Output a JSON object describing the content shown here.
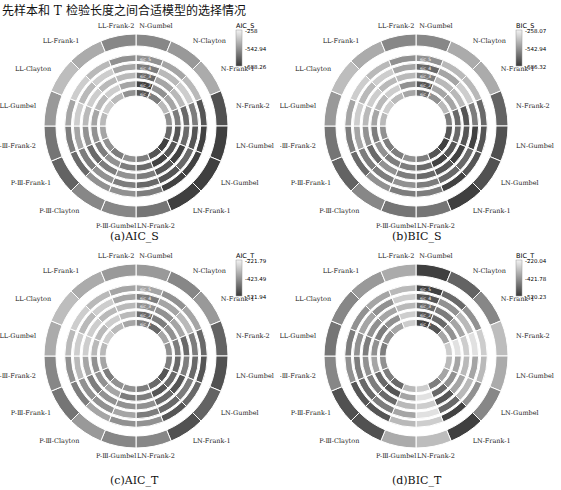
{
  "title": "先样本和 T 检验长度之间合适模型的选择情况",
  "chart_data": [
    {
      "type": "heatmap",
      "subtype": "polar",
      "id": "a",
      "caption": "(a)AIC_S",
      "colorbar": {
        "title": "AIC_S",
        "ticks": [
          "-258",
          "-542.94",
          "-688.26"
        ],
        "min": -688.26,
        "max": -258
      },
      "categories": [
        "N-Gumbel",
        "N-Clayton",
        "N-Frank-1",
        "N-Frank-2",
        "LN-Gumbel",
        "LN-Gumbel",
        "LN-Frank-1",
        "LN-Frank-2",
        "P-Ⅲ-Gumbel",
        "P-Ⅲ-Clayton",
        "P-Ⅲ-Frank-1",
        "P-Ⅲ-Frank-2",
        "LL-Gumbel",
        "LL-Clayton",
        "LL-Frank-1",
        "LL-Frank-2"
      ],
      "rings": [
        "sic_1",
        "sic_2",
        "sic_3",
        "sic_4",
        "sic_5"
      ],
      "values": [
        [
          0.8,
          0.6,
          0.3,
          0.5,
          0.7,
          0.9,
          0.8,
          0.6,
          0.5,
          0.6,
          0.5,
          0.4,
          0.3,
          0.2,
          0.3,
          0.5
        ],
        [
          0.9,
          0.5,
          0.4,
          0.6,
          0.8,
          0.8,
          0.9,
          0.7,
          0.6,
          0.5,
          0.6,
          0.5,
          0.4,
          0.3,
          0.2,
          0.4
        ],
        [
          0.7,
          0.4,
          0.3,
          0.7,
          0.7,
          0.9,
          0.8,
          0.6,
          0.5,
          0.6,
          0.7,
          0.5,
          0.3,
          0.2,
          0.3,
          0.3
        ],
        [
          0.6,
          0.3,
          0.2,
          0.6,
          0.8,
          0.7,
          0.8,
          0.7,
          0.6,
          0.5,
          0.6,
          0.4,
          0.2,
          0.3,
          0.2,
          0.4
        ],
        [
          0.5,
          0.4,
          0.3,
          0.8,
          0.9,
          0.9,
          0.9,
          0.6,
          0.5,
          0.5,
          0.7,
          0.6,
          0.4,
          0.2,
          0.3,
          0.5
        ]
      ]
    },
    {
      "type": "heatmap",
      "subtype": "polar",
      "id": "b",
      "caption": "(b)BIC_S",
      "colorbar": {
        "title": "BIC_S",
        "ticks": [
          "-258.07",
          "-542.94",
          "-686.32"
        ],
        "min": -686.32,
        "max": -258.07
      },
      "categories": [
        "N-Gumbel",
        "N-Clayton",
        "N-Frank-1",
        "N-Frank-2",
        "LN-Gumbel",
        "LN-Gumbel",
        "LN-Frank-1",
        "LN-Frank-2",
        "P-Ⅲ-Gumbel",
        "P-Ⅲ-Clayton",
        "P-Ⅲ-Frank-1",
        "P-Ⅲ-Frank-2",
        "LL-Gumbel",
        "LL-Clayton",
        "LL-Frank-1",
        "LL-Frank-2"
      ],
      "rings": [
        "sic_1",
        "sic_2",
        "sic_3",
        "sic_4",
        "sic_5"
      ],
      "values": [
        [
          0.7,
          0.5,
          0.3,
          0.6,
          0.8,
          0.9,
          0.8,
          0.6,
          0.5,
          0.6,
          0.6,
          0.5,
          0.3,
          0.2,
          0.3,
          0.4
        ],
        [
          0.8,
          0.4,
          0.4,
          0.7,
          0.7,
          0.8,
          0.9,
          0.7,
          0.6,
          0.6,
          0.5,
          0.6,
          0.4,
          0.3,
          0.2,
          0.5
        ],
        [
          0.6,
          0.3,
          0.3,
          0.8,
          0.8,
          0.9,
          0.8,
          0.7,
          0.6,
          0.5,
          0.7,
          0.5,
          0.3,
          0.2,
          0.3,
          0.3
        ],
        [
          0.7,
          0.4,
          0.2,
          0.6,
          0.9,
          0.7,
          0.7,
          0.6,
          0.5,
          0.6,
          0.6,
          0.4,
          0.2,
          0.3,
          0.2,
          0.4
        ],
        [
          0.5,
          0.3,
          0.3,
          0.7,
          0.8,
          0.8,
          0.9,
          0.6,
          0.6,
          0.5,
          0.7,
          0.6,
          0.4,
          0.2,
          0.3,
          0.5
        ]
      ]
    },
    {
      "type": "heatmap",
      "subtype": "polar",
      "id": "c",
      "caption": "(c)AIC_T",
      "colorbar": {
        "title": "AIC_T",
        "ticks": [
          "-221.79",
          "-423.49",
          "-521.94"
        ],
        "min": -521.94,
        "max": -221.79
      },
      "categories": [
        "N-Gumbel",
        "N-Clayton",
        "N-Frank-1",
        "N-Frank-2",
        "LN-Gumbel",
        "LN-Gumbel",
        "LN-Frank-1",
        "LN-Frank-2",
        "P-Ⅲ-Gumbel",
        "P-Ⅲ-Clayton",
        "P-Ⅲ-Frank-1",
        "P-Ⅲ-Frank-2",
        "LL-Gumbel",
        "LL-Clayton",
        "LL-Frank-1",
        "LL-Frank-2"
      ],
      "rings": [
        "sic_1",
        "sic_2",
        "sic_3",
        "sic_4",
        "sic_5"
      ],
      "values": [
        [
          0.6,
          0.7,
          0.4,
          0.5,
          0.6,
          0.8,
          0.7,
          0.6,
          0.5,
          0.5,
          0.6,
          0.4,
          0.3,
          0.2,
          0.3,
          0.4
        ],
        [
          0.7,
          0.6,
          0.5,
          0.6,
          0.7,
          0.7,
          0.8,
          0.6,
          0.6,
          0.4,
          0.5,
          0.5,
          0.3,
          0.3,
          0.2,
          0.3
        ],
        [
          0.5,
          0.5,
          0.4,
          0.7,
          0.6,
          0.8,
          0.7,
          0.5,
          0.5,
          0.5,
          0.6,
          0.4,
          0.2,
          0.2,
          0.3,
          0.3
        ],
        [
          0.6,
          0.4,
          0.3,
          0.6,
          0.7,
          0.6,
          0.7,
          0.6,
          0.4,
          0.5,
          0.5,
          0.3,
          0.2,
          0.3,
          0.2,
          0.4
        ],
        [
          0.4,
          0.5,
          0.4,
          0.7,
          0.8,
          0.7,
          0.8,
          0.5,
          0.5,
          0.4,
          0.6,
          0.5,
          0.3,
          0.2,
          0.3,
          0.4
        ]
      ]
    },
    {
      "type": "heatmap",
      "subtype": "polar",
      "id": "d",
      "caption": "(d)BIC_T",
      "colorbar": {
        "title": "BIC_T",
        "ticks": [
          "-220.04",
          "-421.78",
          "-520.23"
        ],
        "min": -520.23,
        "max": -220.04
      },
      "categories": [
        "N-Gumbel",
        "N-Clayton",
        "N-Frank-1",
        "N-Frank-2",
        "LN-Gumbel",
        "LN-Gumbel",
        "LN-Frank-1",
        "LN-Frank-2",
        "P-Ⅲ-Gumbel",
        "P-Ⅲ-Clayton",
        "P-Ⅲ-Frank-1",
        "P-Ⅲ-Frank-2",
        "LL-Gumbel",
        "LL-Clayton",
        "LL-Frank-1",
        "LL-Frank-2"
      ],
      "rings": [
        "sic_1",
        "sic_2",
        "sic_3",
        "sic_4",
        "sic_5"
      ],
      "values": [
        [
          0.9,
          0.8,
          0.4,
          0.2,
          0.3,
          0.4,
          0.6,
          0.2,
          0.3,
          0.7,
          0.6,
          0.5,
          0.6,
          0.5,
          0.4,
          0.2
        ],
        [
          0.8,
          0.7,
          0.5,
          0.1,
          0.4,
          0.5,
          0.7,
          0.1,
          0.4,
          0.8,
          0.7,
          0.4,
          0.5,
          0.6,
          0.5,
          0.2
        ],
        [
          0.7,
          0.6,
          0.4,
          0.2,
          0.3,
          0.4,
          0.8,
          0.2,
          0.3,
          0.7,
          0.6,
          0.5,
          0.6,
          0.5,
          0.4,
          0.3
        ],
        [
          0.8,
          0.5,
          0.3,
          0.1,
          0.4,
          0.3,
          0.7,
          0.1,
          0.4,
          0.6,
          0.7,
          0.6,
          0.5,
          0.4,
          0.5,
          0.2
        ],
        [
          0.9,
          0.7,
          0.5,
          0.2,
          0.3,
          0.5,
          0.9,
          0.2,
          0.3,
          0.8,
          0.8,
          0.5,
          0.6,
          0.5,
          0.4,
          0.3
        ]
      ]
    }
  ]
}
